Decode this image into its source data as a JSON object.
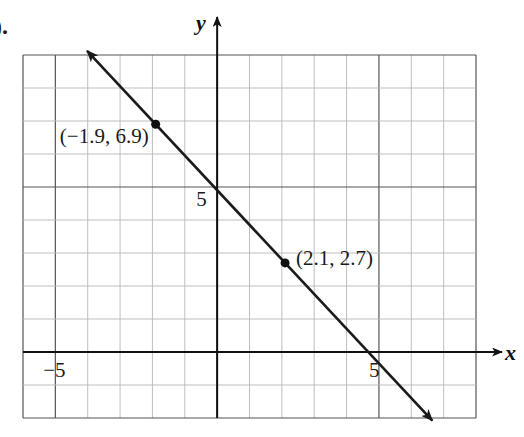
{
  "figure_label": ").",
  "chart_data": {
    "type": "line",
    "title": "",
    "xlabel": "x",
    "ylabel": "y",
    "xlim": [
      -6,
      8
    ],
    "ylim": [
      -2,
      9
    ],
    "grid": true,
    "grid_step": 1,
    "major_grid_step": 5,
    "tick_labels": {
      "x": [
        {
          "value": -5,
          "label": "−5"
        },
        {
          "value": 5,
          "label": "5"
        }
      ],
      "y": [
        {
          "value": 5,
          "label": "5"
        }
      ]
    },
    "series": [
      {
        "name": "line",
        "points": [
          {
            "x": -1.9,
            "y": 6.9
          },
          {
            "x": 2.1,
            "y": 2.7
          }
        ],
        "slope": -1.05,
        "y_intercept": 4.905,
        "arrows_both_ends": true,
        "extent": {
          "x_start": -4.02,
          "x_end": 6.65
        }
      }
    ],
    "annotations": [
      {
        "text": "(−1.9, 6.9)",
        "x": -1.9,
        "y": 6.9,
        "position": "left-below"
      },
      {
        "text": "(2.1, 2.7)",
        "x": 2.1,
        "y": 2.7,
        "position": "right"
      }
    ],
    "colors": {
      "grid_minor": "#b8b8b8",
      "grid_major": "#555555",
      "axes": "#111111",
      "line": "#1a1a1a",
      "points": "#111111"
    }
  }
}
